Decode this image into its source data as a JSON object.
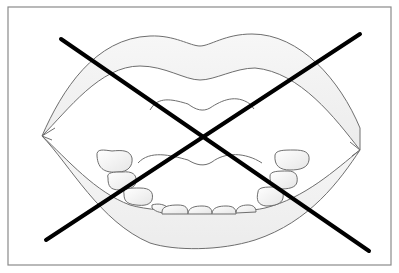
{
  "figure": {
    "overlay": "cross-out X mark",
    "colors": {
      "background": "#ffffff",
      "frame": "#8a8a8a",
      "outline": "#6e6e6e",
      "lip_fill": "#f4f4f4",
      "tooth_fill": "#f7f7f7",
      "cross": "#000000"
    }
  }
}
